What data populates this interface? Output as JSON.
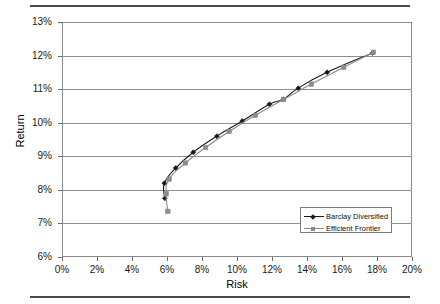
{
  "chart_data": {
    "type": "line",
    "title": "",
    "subtitle": "",
    "xlabel": "Risk",
    "ylabel": "Return",
    "xlim": [
      0,
      20
    ],
    "ylim": [
      6,
      13
    ],
    "xtick_labels": [
      "0%",
      "2%",
      "4%",
      "6%",
      "8%",
      "10%",
      "12%",
      "14%",
      "16%",
      "18%",
      "20%"
    ],
    "xtick_values": [
      0,
      2,
      4,
      6,
      8,
      10,
      12,
      14,
      16,
      18,
      20
    ],
    "ytick_labels": [
      "6%",
      "7%",
      "8%",
      "9%",
      "10%",
      "11%",
      "12%",
      "13%"
    ],
    "ytick_values": [
      6,
      7,
      8,
      9,
      10,
      11,
      12,
      13
    ],
    "grid": "horizontal",
    "legend_position": "inside-lower-right",
    "series": [
      {
        "name": "Barclay Diversified",
        "color": "#1a1a1a",
        "marker": "diamond",
        "points": [
          [
            5.88,
            7.75
          ],
          [
            5.85,
            8.2
          ],
          [
            6.5,
            8.65
          ],
          [
            7.5,
            9.12
          ],
          [
            8.85,
            9.6
          ],
          [
            10.3,
            10.05
          ],
          [
            11.85,
            10.55
          ],
          [
            12.65,
            10.7
          ],
          [
            13.5,
            11.03
          ],
          [
            15.15,
            11.5
          ],
          [
            17.75,
            12.08
          ]
        ]
      },
      {
        "name": "Efficient Frontier",
        "color": "#8c8c8c",
        "marker": "square",
        "points": [
          [
            6.05,
            7.36
          ],
          [
            5.95,
            7.88
          ],
          [
            6.12,
            8.32
          ],
          [
            7.05,
            8.8
          ],
          [
            8.2,
            9.26
          ],
          [
            9.55,
            9.74
          ],
          [
            11.05,
            10.22
          ],
          [
            12.65,
            10.69
          ],
          [
            14.25,
            11.15
          ],
          [
            16.1,
            11.65
          ],
          [
            17.8,
            12.1
          ]
        ]
      }
    ]
  },
  "legend": {
    "items": [
      {
        "label": "Barclay Diversified"
      },
      {
        "label": "Efficient Frontier"
      }
    ]
  },
  "axes": {
    "x_title": "Risk",
    "y_title": "Return"
  }
}
